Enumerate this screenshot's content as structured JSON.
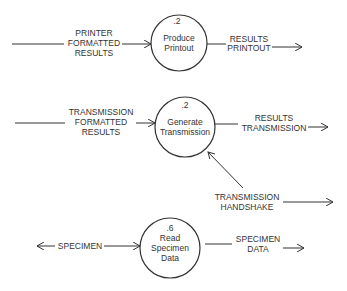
{
  "diagram": {
    "type": "data-flow-diagram",
    "processes": [
      {
        "id": "p1",
        "number": ".2",
        "label_lines": [
          "Produce",
          "Printout"
        ]
      },
      {
        "id": "p2",
        "number": ".2",
        "label_lines": [
          "Generate",
          "Transmission"
        ]
      },
      {
        "id": "p3",
        "number": ".6",
        "label_lines": [
          "Read",
          "Specimen",
          "Data"
        ]
      }
    ],
    "flows": [
      {
        "id": "f1",
        "to": "p1",
        "label_lines": [
          "PRINTER",
          "FORMATTED",
          "RESULTS"
        ]
      },
      {
        "id": "f2",
        "from": "p1",
        "label_lines": [
          "RESULTS",
          "PRINTOUT"
        ]
      },
      {
        "id": "f3",
        "to": "p2",
        "label_lines": [
          "TRANSMISSION",
          "FORMATTED",
          "RESULTS"
        ]
      },
      {
        "id": "f4",
        "from": "p2",
        "label_lines": [
          "RESULTS",
          "TRANSMISSION"
        ]
      },
      {
        "id": "f5",
        "to": "p2",
        "bidirectional_out": true,
        "label_lines": [
          "TRANSMISSION",
          "HANDSHAKE"
        ]
      },
      {
        "id": "f6",
        "to": "p3",
        "bidirectional": true,
        "label_lines": [
          "SPECIMEN"
        ]
      },
      {
        "id": "f7",
        "from": "p3",
        "label_lines": [
          "SPECIMEN",
          "DATA"
        ]
      }
    ]
  }
}
